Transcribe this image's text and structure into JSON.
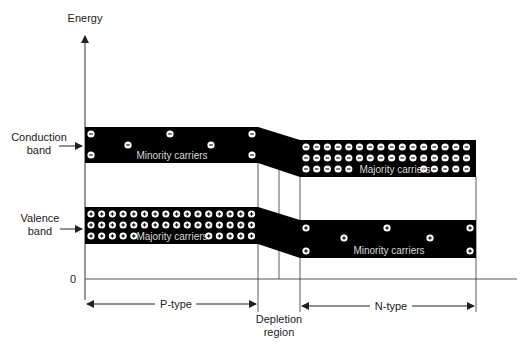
{
  "diagram": {
    "y_axis_label": "Energy",
    "zero_label": "0",
    "conduction_band_label": [
      "Conduction",
      "band"
    ],
    "valence_band_label": [
      "Valence",
      "band"
    ],
    "p_side": {
      "label": "P-type",
      "conduction_text": "Minority carriers",
      "valence_text": "Majority carriers",
      "conduction_carrier": "electron (−)",
      "valence_carrier": "hole (+)"
    },
    "n_side": {
      "label": "N-type",
      "conduction_text": "Majority carriers",
      "valence_text": "Minority carriers",
      "conduction_carrier": "electron (−)",
      "valence_carrier": "hole (+)"
    },
    "depletion_label": [
      "Depletion",
      "region"
    ],
    "colors": {
      "band": "#000000",
      "line": "#333333",
      "text": "#222222",
      "carrier": "#ffffff"
    }
  }
}
